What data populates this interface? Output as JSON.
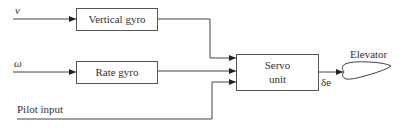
{
  "inputs": {
    "v": "v",
    "omega": "ω",
    "pilot": "Pilot input"
  },
  "blocks": {
    "vertical_gyro": "Vertical gyro",
    "rate_gyro": "Rate gyro",
    "servo_line1": "Servo",
    "servo_line2": "unit",
    "elevator": "Elevator"
  },
  "signals": {
    "servo_output": "δe"
  }
}
